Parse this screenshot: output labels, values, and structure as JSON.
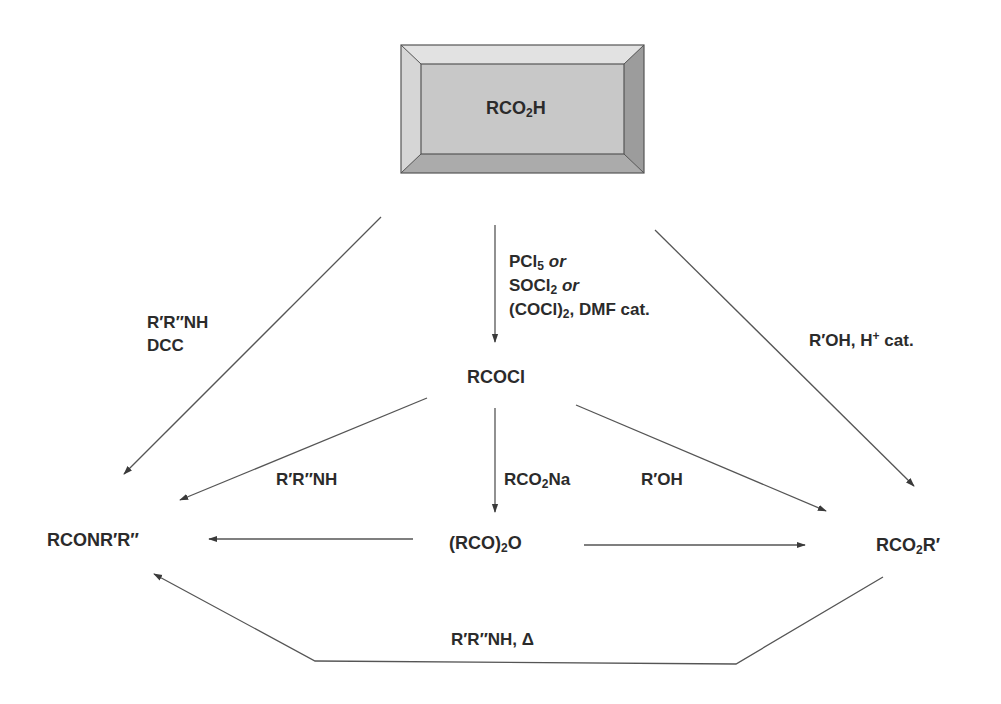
{
  "diagram": {
    "type": "reaction-scheme",
    "colors": {
      "box_face": "#c8c8c8",
      "box_bevel_top": "#e2e2e2",
      "box_bevel_left": "#d8d8d8",
      "box_bevel_right": "#9a9a9a",
      "box_bevel_bottom": "#a8a8a8",
      "line": "#555555",
      "text": "#2b2b2b"
    },
    "nodes": {
      "acid": {
        "pre": "RCO",
        "sub": "2",
        "post": "H"
      },
      "acyl_chloride": {
        "text": "RCOCl"
      },
      "amide": {
        "text": "RCONR′R″"
      },
      "anhydride": {
        "pre": "(RCO)",
        "sub": "2",
        "post": "O"
      },
      "ester": {
        "pre": "RCO",
        "sub": "2",
        "post": "R′"
      }
    },
    "reagents": {
      "acid_to_acylchloride": {
        "line1_pre": "PCl",
        "line1_sub": "5",
        "line1_or": "or",
        "line2_pre": "SOCl",
        "line2_sub": "2",
        "line2_or": "or",
        "line3_pre": "(COCl)",
        "line3_sub": "2",
        "line3_post": ", DMF cat."
      },
      "acid_to_amide": {
        "line1": "R′R″NH",
        "line2": "DCC"
      },
      "acid_to_ester": {
        "pre": "R′OH, H",
        "sup": "+",
        "post": " cat."
      },
      "acylchloride_to_amide": {
        "text": "R′R″NH"
      },
      "acylchloride_to_anhydride": {
        "pre": "RCO",
        "sub": "2",
        "post": "Na"
      },
      "acylchloride_to_ester": {
        "text": "R′OH"
      },
      "ester_to_amide": {
        "text": "R′R″NH, Δ"
      }
    },
    "arrows": [
      {
        "from": "acid",
        "to": "acyl_chloride"
      },
      {
        "from": "acid",
        "to": "amide"
      },
      {
        "from": "acid",
        "to": "ester"
      },
      {
        "from": "acyl_chloride",
        "to": "amide"
      },
      {
        "from": "acyl_chloride",
        "to": "anhydride"
      },
      {
        "from": "acyl_chloride",
        "to": "ester"
      },
      {
        "from": "anhydride",
        "to": "amide"
      },
      {
        "from": "anhydride",
        "to": "ester"
      },
      {
        "from": "ester",
        "to": "amide"
      }
    ]
  }
}
